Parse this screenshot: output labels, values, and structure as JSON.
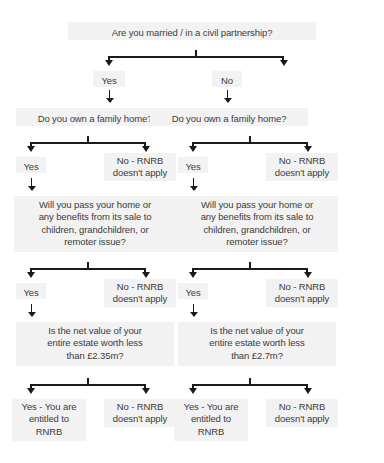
{
  "diagram": {
    "title_question": "Are you married / in a civil partnership?",
    "branch_yes": "Yes",
    "branch_no": "No",
    "left": {
      "q_family_home": "Do you own a family home?",
      "yes_1": "Yes",
      "no_1": "No - RNRB\ndoesn't apply",
      "q_pass_home": "Will you pass your home or\nany benefits from its sale to\nchildren, grandchildren, or\nremoter issue?",
      "yes_2": "Yes",
      "no_2": "No - RNRB\ndoesn't apply",
      "q_net_value": "Is the net value of your\nentire estate worth less\nthan £2.35m?",
      "outcome_yes": "Yes - You are\nentitled to\nRNRB",
      "outcome_no": "No - RNRB\ndoesn't apply"
    },
    "right": {
      "q_family_home": "Do you own a family home?",
      "yes_1": "Yes",
      "no_1": "No - RNRB\ndoesn't apply",
      "q_pass_home": "Will you pass your home or\nany benefits from its sale to\nchildren, grandchildren, or\nremoter issue?",
      "yes_2": "Yes",
      "no_2": "No - RNRB\ndoesn't apply",
      "q_net_value": "Is the net value of your\nentire estate worth less\nthan £2.7m?",
      "outcome_yes": "Yes - You are\nentitled to\nRNRB",
      "outcome_no": "No - RNRB\ndoesn't apply"
    },
    "colors": {
      "box_background": "#f2f2f2",
      "text": "#3c3c3c",
      "connector": "#1a1a1a",
      "page_background": "#ffffff"
    }
  }
}
